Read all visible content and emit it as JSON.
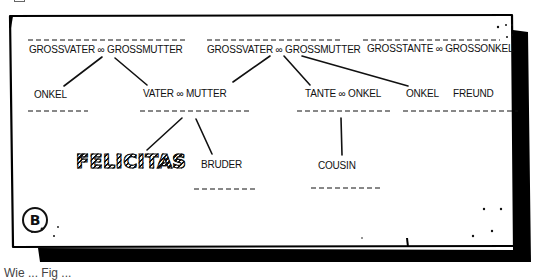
{
  "diagram": {
    "type": "family-tree-sketch",
    "panel_label": "B",
    "colors": {
      "ink": "#111111",
      "paper": "#ffffff",
      "shadow": "#000000"
    },
    "generations": {
      "grandparents": [
        {
          "id": "g1",
          "label": "GROSSVATER ∞ GROSSMUTTER"
        },
        {
          "id": "g2",
          "label": "GROSSVATER ∞ GROSSMUTTER"
        },
        {
          "id": "g3",
          "label": "GROSSTANTE ∞ GROSSONKEL"
        }
      ],
      "parents": [
        {
          "id": "p1",
          "label": "ONKEL"
        },
        {
          "id": "p2",
          "label": "VATER ∞ MUTTER"
        },
        {
          "id": "p3",
          "label": "TANTE ∞ ONKEL"
        },
        {
          "id": "p4",
          "label": "ONKEL"
        },
        {
          "id": "p5",
          "label": "FREUND"
        }
      ],
      "children": [
        {
          "id": "c1",
          "label": "FELICITAS",
          "highlighted": true
        },
        {
          "id": "c2",
          "label": "BRUDER"
        },
        {
          "id": "c3",
          "label": "COUSIN"
        }
      ]
    },
    "edges": [
      {
        "from": "g1",
        "to": "p1"
      },
      {
        "from": "g1",
        "to": "p2"
      },
      {
        "from": "g2",
        "to": "p2"
      },
      {
        "from": "g2",
        "to": "p3"
      },
      {
        "from": "g2",
        "to": "p4"
      },
      {
        "from": "p2",
        "to": "c1"
      },
      {
        "from": "p2",
        "to": "c2"
      },
      {
        "from": "p3",
        "to": "c3"
      }
    ]
  },
  "caption": "Wie ... Fig ..."
}
